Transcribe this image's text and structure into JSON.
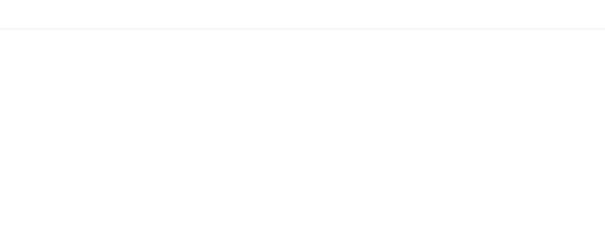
{
  "header": {
    "note": "not to scale"
  },
  "labels": {
    "glass_tank": "glass tank",
    "normal_top": "normal",
    "refracted_ray": "refracted ray",
    "reflected_ray": "reflected ray",
    "water": "water",
    "theta": "θ",
    "normal_mirror": "normal",
    "mirror": "mirror",
    "point_c": "C",
    "laser_light": "laser light"
  },
  "colors": {
    "water": "#d6d6d6",
    "lines": "#222222",
    "mirror": "#8a8a8a"
  }
}
